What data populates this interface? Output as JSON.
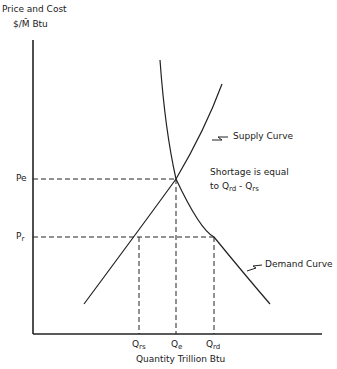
{
  "diagram": {
    "y_axis_label_line1": "Price and Cost",
    "y_axis_label_line2": "$/M̄ Btu",
    "x_axis_label": "Quantity Trillion Btu",
    "price_labels": {
      "equilibrium": "P",
      "equilibrium_sub": "e",
      "regulated": "P",
      "regulated_sub": "r"
    },
    "quantity_labels": {
      "supplied_regulated": "Q",
      "supplied_regulated_sub": "rs",
      "equilibrium": "Q",
      "equilibrium_sub": "e",
      "demanded_regulated": "Q",
      "demanded_regulated_sub": "rd"
    },
    "curves": {
      "supply": "Supply Curve",
      "demand": "Demand Curve"
    },
    "annotation_line1": "Shortage is equal",
    "annotation_line2_prefix": "to Q",
    "annotation_sub1": "rd",
    "annotation_mid": " - Q",
    "annotation_sub2": "rs"
  }
}
